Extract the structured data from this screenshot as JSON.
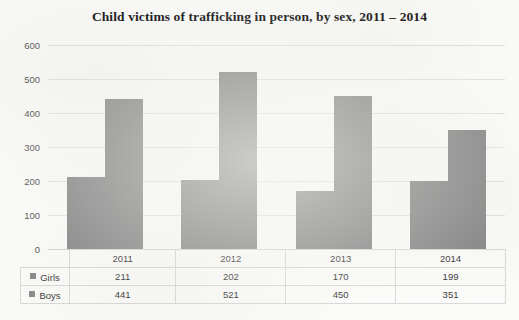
{
  "title": "Child victims of trafficking in person, by sex, 2011 – 2014",
  "chart_data": {
    "type": "bar",
    "title": "Child victims of trafficking in person, by sex, 2011 – 2014",
    "xlabel": "",
    "ylabel": "",
    "categories": [
      "2011",
      "2012",
      "2013",
      "2014"
    ],
    "series": [
      {
        "name": "Girls",
        "values": [
          211,
          202,
          170,
          199
        ],
        "color": "#8b8b8b"
      },
      {
        "name": "Boys",
        "values": [
          441,
          521,
          450,
          351
        ],
        "color": "#8b8b8b"
      }
    ],
    "ylim": [
      0,
      600
    ],
    "yticks": [
      0,
      100,
      200,
      300,
      400,
      500,
      600
    ],
    "ytick_labels": [
      "0",
      "100",
      "200",
      "300",
      "400",
      "500",
      "600"
    ],
    "grid": true,
    "legend_position": "table-left",
    "data_table_visible": true
  },
  "table": {
    "year_headers": [
      "2011",
      "2012",
      "2013",
      "2014"
    ],
    "rows": [
      {
        "label": "Girls",
        "values": [
          "211",
          "202",
          "170",
          "199"
        ]
      },
      {
        "label": "Boys",
        "values": [
          "441",
          "521",
          "450",
          "351"
        ]
      }
    ]
  },
  "colors": {
    "bar": "#8b8b8b",
    "gridline": "#e2e2e2",
    "text": "#3b3b3b",
    "background": "#fbfbf9"
  }
}
